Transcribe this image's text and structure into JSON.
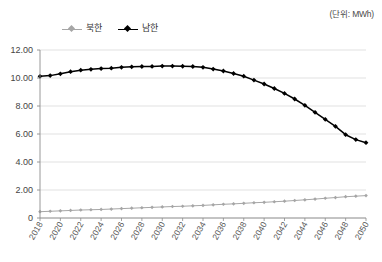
{
  "unit_note": "(단위: MWh)",
  "legend": {
    "position": "top-left",
    "entries": [
      {
        "label": "북한",
        "color": "#a6a6a6",
        "marker": "diamond"
      },
      {
        "label": "남한",
        "color": "#000000",
        "marker": "diamond"
      }
    ]
  },
  "axes": {
    "y_ticks": [
      "0",
      "2.00",
      "4.00",
      "6.00",
      "8.00",
      "10.00",
      "12.00"
    ],
    "x_ticks": [
      "2018",
      "2020",
      "2022",
      "2024",
      "2026",
      "2028",
      "2030",
      "2032",
      "2034",
      "2036",
      "2038",
      "2040",
      "2042",
      "2044",
      "2046",
      "2048",
      "2050"
    ]
  },
  "chart_data": {
    "type": "line",
    "title": "",
    "subtitle": "",
    "xlabel": "",
    "ylabel": "",
    "unit": "MWh",
    "ylim": [
      0,
      12
    ],
    "ytick_step": 2,
    "xlim": [
      2018,
      2050
    ],
    "grid": true,
    "legend_position": "top-left",
    "x": [
      2018,
      2019,
      2020,
      2021,
      2022,
      2023,
      2024,
      2025,
      2026,
      2027,
      2028,
      2029,
      2030,
      2031,
      2032,
      2033,
      2034,
      2035,
      2036,
      2037,
      2038,
      2039,
      2040,
      2041,
      2042,
      2043,
      2044,
      2045,
      2046,
      2047,
      2048,
      2049,
      2050
    ],
    "series": [
      {
        "name": "북한",
        "color": "#a6a6a6",
        "marker": "diamond",
        "values": [
          0.45,
          0.48,
          0.51,
          0.54,
          0.57,
          0.59,
          0.61,
          0.64,
          0.67,
          0.7,
          0.73,
          0.76,
          0.79,
          0.82,
          0.84,
          0.87,
          0.9,
          0.94,
          0.98,
          1.01,
          1.05,
          1.09,
          1.12,
          1.16,
          1.2,
          1.25,
          1.3,
          1.35,
          1.41,
          1.46,
          1.52,
          1.56,
          1.6
        ]
      },
      {
        "name": "남한",
        "color": "#000000",
        "marker": "diamond",
        "values": [
          10.12,
          10.17,
          10.3,
          10.45,
          10.56,
          10.62,
          10.67,
          10.7,
          10.76,
          10.8,
          10.82,
          10.83,
          10.85,
          10.85,
          10.84,
          10.82,
          10.76,
          10.64,
          10.5,
          10.32,
          10.13,
          9.85,
          9.57,
          9.25,
          8.9,
          8.5,
          8.05,
          7.55,
          7.05,
          6.55,
          5.95,
          5.6,
          5.38
        ]
      }
    ]
  },
  "layout": {
    "plot_left": 40,
    "plot_right": 366,
    "plot_top": 50,
    "plot_bottom": 218
  }
}
